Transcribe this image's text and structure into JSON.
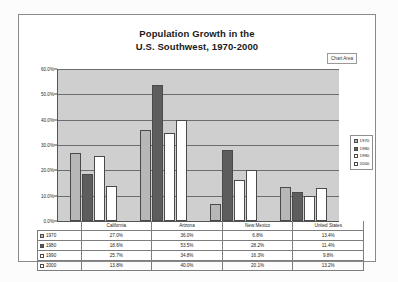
{
  "chart_data": {
    "type": "bar",
    "title": "Population Growth in the U.S. Southwest, 1970-2000",
    "title_line1": "Population Growth in the",
    "title_line2": "U.S. Southwest, 1970-2000",
    "xlabel": "",
    "ylabel": "",
    "ylim": [
      0,
      60
    ],
    "grid": true,
    "legend_position": "right",
    "ytick_labels": [
      "60.0%",
      "50.0%",
      "40.0%",
      "30.0%",
      "20.0%",
      "10.0%",
      "0.0%"
    ],
    "ytick_values": [
      60,
      50,
      40,
      30,
      20,
      10,
      0
    ],
    "categories": [
      "California",
      "Arizona",
      "New Mexico",
      "United States"
    ],
    "series": [
      {
        "name": "1970",
        "color": "#b7b7b7",
        "values": [
          27.0,
          36.0,
          6.8,
          13.4
        ],
        "labels": [
          "27.0%",
          "36.0%",
          "6.8%",
          "13.4%"
        ]
      },
      {
        "name": "1980",
        "color": "#5d5d5d",
        "values": [
          18.6,
          53.5,
          28.2,
          11.4
        ],
        "labels": [
          "18.6%",
          "53.5%",
          "28.2%",
          "11.4%"
        ]
      },
      {
        "name": "1990",
        "color": "#ffffff",
        "values": [
          25.7,
          34.8,
          16.3,
          9.8
        ],
        "labels": [
          "25.7%",
          "34.8%",
          "16.3%",
          "9.8%"
        ]
      },
      {
        "name": "2000",
        "color": "#ffffff",
        "values": [
          13.8,
          40.0,
          20.1,
          13.2
        ],
        "labels": [
          "13.8%",
          "40.0%",
          "20.1%",
          "13.2%"
        ]
      }
    ]
  },
  "overlay": {
    "chart_area_label": "Chart Area"
  },
  "legend": {
    "items": [
      {
        "label": "1970"
      },
      {
        "label": "1980"
      },
      {
        "label": "1990"
      },
      {
        "label": "2000"
      }
    ]
  },
  "table": {
    "header": [
      "",
      "California",
      "Arizona",
      "New Mexico",
      "United States"
    ],
    "rows": [
      {
        "year": "1970",
        "cells": [
          "27.0%",
          "36.0%",
          "6.8%",
          "13.4%"
        ]
      },
      {
        "year": "1980",
        "cells": [
          "18.6%",
          "53.5%",
          "28.2%",
          "11.4%"
        ]
      },
      {
        "year": "1990",
        "cells": [
          "25.7%",
          "34.8%",
          "16.3%",
          "9.8%"
        ]
      },
      {
        "year": "2000",
        "cells": [
          "13.8%",
          "40.0%",
          "20.1%",
          "13.2%"
        ]
      }
    ]
  }
}
